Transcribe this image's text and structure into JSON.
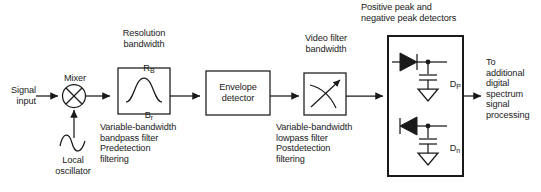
{
  "diagram": {
    "type": "block-diagram",
    "stroke_color": "#1a1a1a",
    "background": "#ffffff"
  },
  "labels": {
    "signal_input": "Signal\ninput",
    "mixer": "Mixer",
    "local_oscillator": "Local\noscillator",
    "resolution_bandwidth": "Resolution\nbandwidth",
    "rb_symbol": "R",
    "rb_subscript": "B",
    "br_symbol": "B",
    "br_subscript": "r",
    "bandpass_caption": "Variable-bandwidth\nbandpass filter\nPredetection\nfiltering",
    "envelope_detector": "Envelope\ndetector",
    "video_filter_bandwidth": "Video filter\nbandwidth",
    "lowpass_caption": "Variable-bandwidth\nlowpass filter\nPostdetection\nfiltering",
    "peak_detectors_title": "Positive peak and\nnegative peak detectors",
    "dp_symbol": "D",
    "dp_subscript": "P",
    "dn_symbol": "D",
    "dn_subscript": "n",
    "output_caption": "To\nadditional\ndigital\nspectrum\nsignal\nprocessing"
  },
  "blocks": [
    {
      "name": "mixer",
      "shape": "circle-x",
      "label": "Mixer"
    },
    {
      "name": "local-oscillator",
      "shape": "sine-wave",
      "label": "Local oscillator"
    },
    {
      "name": "bandpass-filter",
      "shape": "box-bellcurve",
      "label": "Variable-bandwidth bandpass filter"
    },
    {
      "name": "envelope-detector",
      "shape": "box-text",
      "label": "Envelope detector"
    },
    {
      "name": "lowpass-filter",
      "shape": "box-slope-arrow",
      "label": "Variable-bandwidth lowpass filter"
    },
    {
      "name": "peak-detectors",
      "shape": "box-diode-network",
      "label": "Positive and negative peak detectors"
    }
  ],
  "components": [
    {
      "name": "positive-peak-diode",
      "label": "D_P",
      "direction": "right"
    },
    {
      "name": "negative-peak-diode",
      "label": "D_n",
      "direction": "left"
    },
    {
      "name": "positive-peak-capacitor",
      "label": ""
    },
    {
      "name": "negative-peak-capacitor",
      "label": ""
    },
    {
      "name": "positive-peak-ground",
      "label": ""
    },
    {
      "name": "negative-peak-ground",
      "label": ""
    }
  ]
}
